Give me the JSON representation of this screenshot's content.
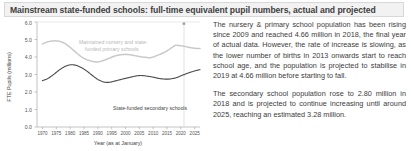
{
  "title": {
    "text": "Mainstream state-funded schools: full-time equivalent pupil numbers, actual and projected"
  },
  "body": {
    "paragraph1": "The nursery & primary school population has been rising since 2009 and reached 4.66 million in 2018, the final year of actual data. However, the rate of increase is slowing, as the lower number of births in 2013 onwards start to reach school age, and the population is projected to stabilise in 2019 at 4.66 million before starting to fall.",
    "paragraph2": "The secondary school population rose to 2.80 million in 2018 and is projected to continue increasing until around 2025, reaching an estimated 3.28 million."
  },
  "chart_data": {
    "type": "line",
    "title": "Mainstream state-funded schools: full-time equivalent pupil numbers, actual and projected",
    "xlabel": "Year (as at January)",
    "ylabel": "FTE Pupils (millions)",
    "xlim": [
      1968,
      2027
    ],
    "ylim": [
      0.0,
      6.0
    ],
    "ytick_labels": [
      "0.0",
      "1.0",
      "2.0",
      "3.0",
      "4.0",
      "5.0",
      "6.0"
    ],
    "ytick_values": [
      0.0,
      1.0,
      2.0,
      3.0,
      4.0,
      5.0,
      6.0
    ],
    "xtick_labels": [
      "1970",
      "1975",
      "1980",
      "1985",
      "1990",
      "1995",
      "2000",
      "2005",
      "2010",
      "2015",
      "2020",
      "2025"
    ],
    "xtick_values": [
      1970,
      1975,
      1980,
      1985,
      1990,
      1995,
      2000,
      2005,
      2010,
      2015,
      2020,
      2025
    ],
    "grid": false,
    "legend": "inline-annotations",
    "projection_boundary_year": 2018,
    "series": [
      {
        "name": "Maintained nursery and state-funded primary schools",
        "color": "#c9c9c9",
        "label_text": [
          "Maintained nursery and state-",
          "funded primary schools"
        ],
        "x": [
          1970,
          1972,
          1974,
          1976,
          1978,
          1980,
          1982,
          1984,
          1986,
          1988,
          1990,
          1992,
          1994,
          1996,
          1998,
          2000,
          2002,
          2004,
          2006,
          2008,
          2009,
          2010,
          2012,
          2014,
          2016,
          2018,
          2019,
          2021,
          2023,
          2025,
          2027
        ],
        "y": [
          4.75,
          4.87,
          4.92,
          4.9,
          4.78,
          4.55,
          4.28,
          4.02,
          3.85,
          3.75,
          3.72,
          3.8,
          3.92,
          4.05,
          4.12,
          4.15,
          4.12,
          4.06,
          4.0,
          3.97,
          3.96,
          4.0,
          4.12,
          4.26,
          4.45,
          4.66,
          4.66,
          4.62,
          4.55,
          4.5,
          4.48
        ]
      },
      {
        "name": "State-funded secondary schools",
        "color": "#4a4a4a",
        "label_text": [
          "State-funded secondary schools"
        ],
        "x": [
          1970,
          1972,
          1974,
          1976,
          1978,
          1980,
          1982,
          1984,
          1986,
          1988,
          1990,
          1992,
          1994,
          1996,
          1998,
          2000,
          2002,
          2004,
          2006,
          2008,
          2010,
          2012,
          2014,
          2016,
          2018,
          2019,
          2021,
          2023,
          2025,
          2027
        ],
        "y": [
          2.65,
          2.78,
          3.0,
          3.25,
          3.45,
          3.55,
          3.53,
          3.4,
          3.2,
          2.95,
          2.72,
          2.58,
          2.55,
          2.62,
          2.7,
          2.78,
          2.85,
          2.92,
          2.94,
          2.9,
          2.85,
          2.78,
          2.74,
          2.74,
          2.8,
          2.85,
          2.98,
          3.1,
          3.2,
          3.28
        ]
      }
    ],
    "annotations": [
      {
        "text": "3.28 million estimated peak",
        "year": 2025,
        "value": 3.28
      },
      {
        "text": "4.66 million in 2018",
        "year": 2018,
        "value": 4.66
      },
      {
        "text": "2.80 million in 2018",
        "year": 2018,
        "value": 2.8
      }
    ]
  }
}
